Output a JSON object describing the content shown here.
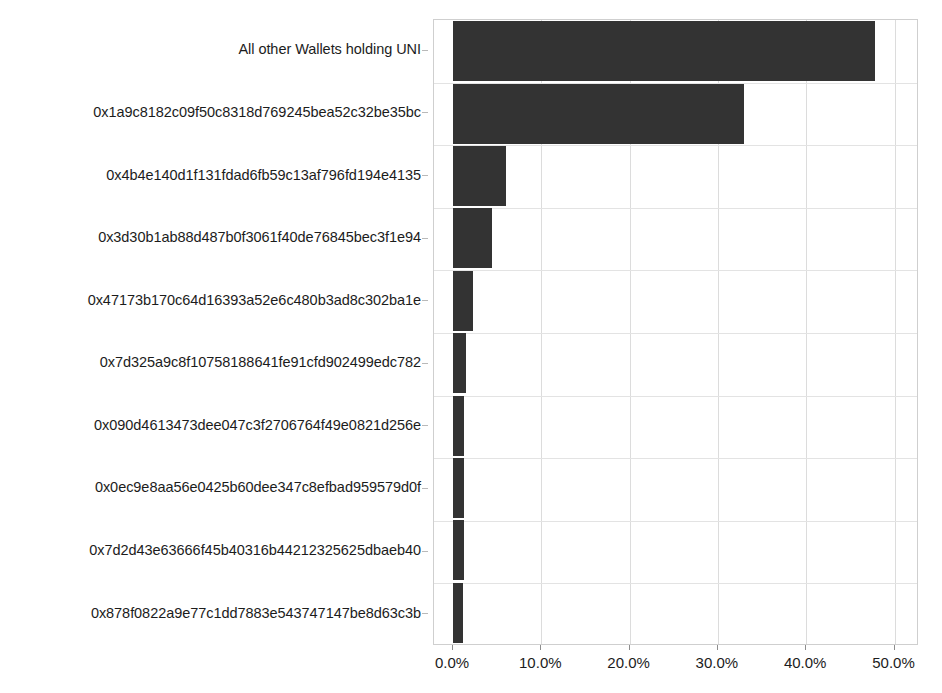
{
  "chart_data": {
    "type": "bar",
    "orientation": "horizontal",
    "title": "",
    "xlabel": "",
    "ylabel": "",
    "xlim": [
      0,
      55
    ],
    "xticks": [
      0,
      10,
      20,
      30,
      40,
      50
    ],
    "xtick_labels": [
      "0.0%",
      "10.0%",
      "20.0%",
      "30.0%",
      "40.0%",
      "50.0%"
    ],
    "grid": true,
    "legend": false,
    "value_suffix": "%",
    "bar_color": "#333333",
    "categories": [
      "All other Wallets holding UNI",
      "0x1a9c8182c09f50c8318d769245bea52c32be35bc",
      "0x4b4e140d1f131fdad6fb59c13af796fd194e4135",
      "0x3d30b1ab88d487b0f3061f40de76845bec3f1e94",
      "0x47173b170c64d16393a52e6c480b3ad8c302ba1e",
      "0x7d325a9c8f10758188641fe91cfd902499edc782",
      "0x090d4613473dee047c3f2706764f49e0821d256e",
      "0x0ec9e8aa56e0425b60dee347c8efbad959579d0f",
      "0x7d2d43e63666f45b40316b44212325625dbaeb40",
      "0x878f0822a9e77c1dd7883e543747147be8d63c3b"
    ],
    "values": [
      47.8,
      32.9,
      6.0,
      4.4,
      2.3,
      1.5,
      1.2,
      1.2,
      1.2,
      1.1
    ]
  }
}
